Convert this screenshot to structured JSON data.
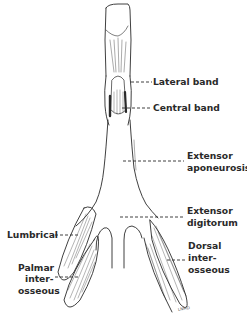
{
  "diagram": {
    "labels": {
      "lateral_band": "Lateral band",
      "central_band": "Central band",
      "extensor_aponeurosis_1": "Extensor",
      "extensor_aponeurosis_2": "aponeurosis",
      "extensor_digitorum_1": "Extensor",
      "extensor_digitorum_2": "digitorum",
      "lumbrical": "Lumbrical",
      "palmar_interosseous_1": "Palmar",
      "palmar_interosseous_2": "inter-",
      "palmar_interosseous_3": "osseous",
      "dorsal_interosseous_1": "Dorsal",
      "dorsal_interosseous_2": "inter-",
      "dorsal_interosseous_3": "osseous"
    },
    "signature": "LNMD",
    "colors": {
      "line": "#2a2a2a",
      "background": "#ffffff"
    }
  }
}
